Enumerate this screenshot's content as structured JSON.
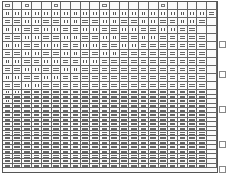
{
  "document": {
    "type": "scanned grid chart",
    "columns": 22,
    "legend": {
      "v": "vertical-bars cell",
      "h": "horizontal-bars cell",
      "m": "small mark",
      "l": "single line",
      ".": "blank"
    }
  },
  "grid": {
    "header": "m.m..m....m.....m.....",
    "rows_tall": [
      "vvvvvvvvvvvvvvvvvvvvvh",
      "hhvvhhvvhhvvhhvvhhvvh.",
      "vvhhvvhhvvhhvvhhvvhh..",
      "hhvvhhvvhhvvhhvvhhhhh.",
      "vvhhvvhhvvhhvvhhhhhhh.",
      "hhvvhhvvhhvvhhhhhhhhh.",
      "vvhhvvhhvvhhhhhhhhhhh.",
      "hhvvhhvvhhhhhhhhhhhhh.",
      "vvhhvvhhhhhhhhhhhhhhh.",
      "hhvvhhhhhhhhhhhhhhhhh."
    ],
    "rows_short": [
      "vvhhhhhhhhhhhhhhhhhhh.",
      "hhhhhhhhhhhhhhhhhhhhh.",
      "vhhhhhhhhhhhhhhhhhhhh.",
      "hhhhhhhhhhhhhhhhhhhhh.",
      "hhhhhhhhhhhhhhhhhhhhh.",
      "hhhhhhhhhhhhhhhhhhhhh.",
      "hhhhhhhhhhhhhhhhhhhhh.",
      "hhhhhhhhhhhhhhhhhhhhh.",
      "hhhhhhhhhhhhhhhhhhhhh.",
      "hhhhhhhhhhhhhhhhhhhhh.",
      "hhhhhhhhhhhhhhhhhhhhh.",
      "hhhhhhhhhhhhhhhhhhhhh.",
      "hhhhhhhhhhhhhhhhhhhhh.",
      "hhhhhhhhhhhhhhhhhhhhh.",
      "hhhhhhhhhhhhhhhhhhhhh.",
      "hhhhhhhhhhhhhhhhhhhhh.",
      "hhhhhhhhhhhhhhhhhhhhh."
    ],
    "margin_marks_y": [
      40,
      70,
      105,
      140,
      165
    ]
  }
}
